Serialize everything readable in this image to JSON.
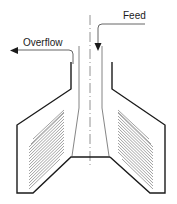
{
  "diagram": {
    "type": "hydrocyclone-classifier-schematic",
    "labels": {
      "feed": "Feed",
      "overflow": "Overflow"
    },
    "icons": {
      "feed_arrow": "arrow-down-icon",
      "overflow_arrow": "arrow-left-icon"
    },
    "colors": {
      "line": "#1a1a1a",
      "thin_line": "#555555",
      "hatch": "#7a7a7a",
      "background": "#ffffff"
    },
    "components": [
      "centerline",
      "feed-inlet-pipe",
      "overflow-outlet-pipe",
      "central-feed-column",
      "left-settling-chamber",
      "right-settling-chamber",
      "inclined-plates-left",
      "inclined-plates-right"
    ]
  }
}
